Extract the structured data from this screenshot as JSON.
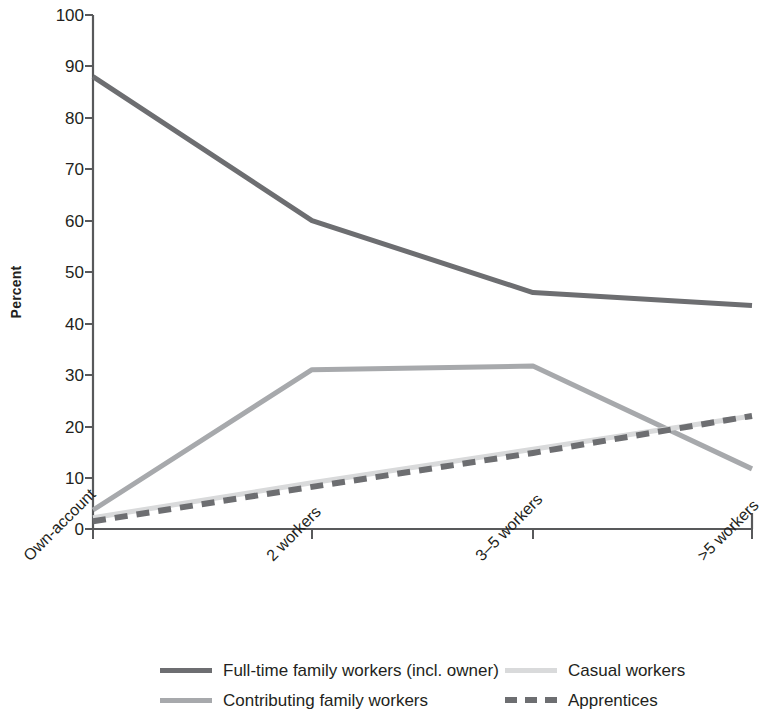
{
  "chart_data": {
    "type": "line",
    "title": "",
    "subtitle": "",
    "xlabel": "",
    "ylabel": "Percent",
    "categories": [
      "Own-account",
      "2 workers",
      "3–5 workers",
      ">5 workers"
    ],
    "ylim": [
      0,
      100
    ],
    "yticks": [
      0,
      10,
      20,
      30,
      40,
      50,
      60,
      70,
      80,
      90,
      100
    ],
    "grid": false,
    "legend_position": "bottom",
    "series": [
      {
        "name": "Full-time family workers (incl. owner)",
        "values": [
          88,
          60,
          46,
          43.5
        ],
        "color": "#6d6e71",
        "style": "solid",
        "width": 5
      },
      {
        "name": "Contributing family workers",
        "values": [
          3.7,
          31,
          31.7,
          11.7
        ],
        "color": "#a7a9ac",
        "style": "solid",
        "width": 5
      },
      {
        "name": "Casual workers",
        "values": [
          2.2,
          9,
          15.5,
          22
        ],
        "color": "#d9dadb",
        "style": "solid",
        "width": 5
      },
      {
        "name": "Apprentices",
        "values": [
          1.5,
          8.2,
          14.8,
          22
        ],
        "color": "#6d6e71",
        "style": "dashed",
        "width": 6
      }
    ]
  },
  "axis": {
    "y_title": "Percent",
    "y_tick_labels": [
      "100",
      "90",
      "80",
      "70",
      "60",
      "50",
      "40",
      "30",
      "20",
      "10",
      "0"
    ],
    "x_tick_labels": [
      "Own-account",
      "2 workers",
      "3–5 workers",
      ">5 workers"
    ]
  },
  "legend": {
    "entries": [
      {
        "label": "Full-time family workers (incl. owner)",
        "color": "#6d6e71",
        "style": "solid"
      },
      {
        "label": "Casual workers",
        "color": "#d9dadb",
        "style": "solid"
      },
      {
        "label": "Contributing family workers",
        "color": "#a7a9ac",
        "style": "solid"
      },
      {
        "label": "Apprentices",
        "color": "#6d6e71",
        "style": "dashed"
      }
    ]
  }
}
